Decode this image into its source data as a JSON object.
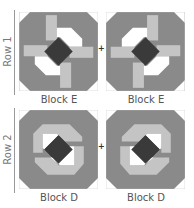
{
  "rows": [
    {
      "label": "Row 1",
      "blocks": [
        {
          "label": "Block E",
          "variant": "E",
          "mirror": false
        },
        {
          "label": "Block E",
          "variant": "E",
          "mirror": true
        }
      ]
    },
    {
      "label": "Row 2",
      "blocks": [
        {
          "label": "Block D",
          "variant": "D",
          "mirror": false
        },
        {
          "label": "Block D",
          "variant": "D",
          "mirror": true
        }
      ]
    }
  ],
  "join_symbol": "+",
  "colors": {
    "dark_frame": "#8a8a8a",
    "light": "#c4c4c4",
    "white": "#ffffff",
    "center": "#3a3a3a",
    "mid": "#a0a0a0"
  }
}
